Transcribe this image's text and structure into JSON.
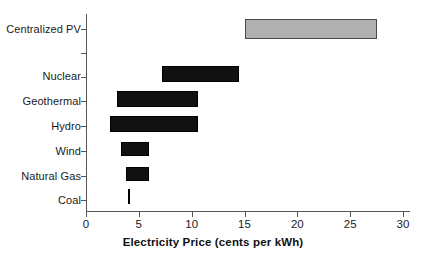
{
  "chart_data": {
    "type": "bar",
    "orientation": "horizontal",
    "subtype": "range-bar",
    "title": "",
    "xlabel": "Electricity Price (cents per kWh)",
    "ylabel": "",
    "xlim": [
      0,
      30
    ],
    "xticks": [
      0,
      5,
      10,
      15,
      20,
      25,
      30
    ],
    "xtick_labels": [
      "0",
      "5",
      "10",
      "15",
      "20",
      "25",
      "30"
    ],
    "grid": false,
    "legend": "none",
    "categories": [
      "Centralized PV",
      "",
      "Nuclear",
      "Geothermal",
      "Hydro",
      "Wind",
      "Natural Gas",
      "Coal"
    ],
    "bars": [
      {
        "category": "Centralized PV",
        "low": 15.0,
        "high": 27.5,
        "color": "#b0b0b0",
        "edgecolor": "#4a4a4a"
      },
      {
        "category": "Nuclear",
        "low": 7.2,
        "high": 14.5,
        "color": "#111111",
        "edgecolor": "#000000"
      },
      {
        "category": "Geothermal",
        "low": 2.9,
        "high": 10.6,
        "color": "#111111",
        "edgecolor": "#000000"
      },
      {
        "category": "Hydro",
        "low": 2.3,
        "high": 10.6,
        "color": "#111111",
        "edgecolor": "#000000"
      },
      {
        "category": "Wind",
        "low": 3.3,
        "high": 6.0,
        "color": "#111111",
        "edgecolor": "#000000"
      },
      {
        "category": "Natural Gas",
        "low": 3.8,
        "high": 6.0,
        "color": "#111111",
        "edgecolor": "#000000"
      },
      {
        "category": "Coal",
        "low": 4.0,
        "high": 4.2,
        "color": "#111111",
        "edgecolor": "#000000"
      }
    ]
  },
  "axis": {
    "x_title": "Electricity Price (cents per kWh)",
    "tick_labels": [
      "0",
      "5",
      "10",
      "15",
      "20",
      "25",
      "30"
    ]
  },
  "category_labels": [
    "Centralized PV",
    "Nuclear",
    "Geothermal",
    "Hydro",
    "Wind",
    "Natural Gas",
    "Coal"
  ],
  "colors": {
    "bar_dark": "#111111",
    "bar_light": "#b0b0b0",
    "bar_light_edge": "#4a4a4a",
    "axis": "#555555",
    "text": "#1a1a1a",
    "background": "#ffffff"
  }
}
